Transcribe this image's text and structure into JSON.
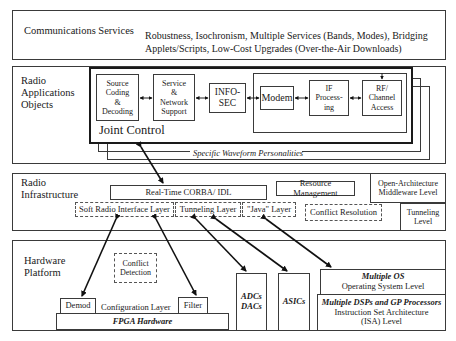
{
  "layers": {
    "comm": {
      "label": "Communications Services",
      "desc_line1": "Robustness,  Isochronism, Multiple Services (Bands, Modes), Bridging",
      "desc_line2": "Applets/Scripts, Low-Cost Upgrades (Over-the-Air Downloads)"
    },
    "apps": {
      "label_line1": "Radio",
      "label_line2": "Applications",
      "label_line3": "Objects",
      "blocks": {
        "source": [
          "Source",
          "Coding",
          "&",
          "Decoding"
        ],
        "service": [
          "Service",
          "&",
          "Network",
          "Support"
        ],
        "infosec": [
          "INFO-",
          "SEC"
        ],
        "modem": "Modem",
        "if": [
          "IF",
          "Process-",
          "ing"
        ],
        "rf": [
          "RF/",
          "Channel",
          "Access"
        ]
      },
      "joint_control": "Joint Control",
      "waveform": "Specific Waveform Personalities"
    },
    "infra": {
      "label_line1": "Radio",
      "label_line2": "Infrastructure",
      "corba": "Real-Time CORBA/ IDL",
      "resource": "Resource Management",
      "middleware_line1": "Open-Architecture",
      "middleware_line2": "Middleware Level",
      "soft_radio": "Soft Radio Interface Layer",
      "tunneling": "Tunneling Layer",
      "java": "\"Java\" Layer",
      "conflict_res": "Conflict Resolution",
      "tunnel_level_line1": "Tunneling",
      "tunnel_level_line2": "Level"
    },
    "hw": {
      "label_line1": "Hardware",
      "label_line2": "Platform",
      "conflict_det_line1": "Conflict",
      "conflict_det_line2": "Detection",
      "demod": "Demod",
      "config": "Configuration Layer",
      "filter": "Filter",
      "fpga": "FPGA Hardware",
      "adcs": "ADCs",
      "dacs": "DACs",
      "asics": "ASICs",
      "os_title": "Multiple OS",
      "os_sub": "Operating System Level",
      "dsp_title": "Multiple DSPs and GP Processors",
      "dsp_sub1": "Instruction Set Architecture",
      "dsp_sub2": "(ISA) Level"
    }
  }
}
